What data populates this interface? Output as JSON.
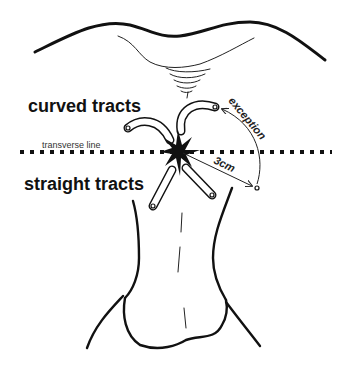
{
  "diagram": {
    "labels": {
      "curved_tracts": "curved tracts",
      "straight_tracts": "straight tracts",
      "transverse_line": "transverse line",
      "exception": "exception",
      "distance": "3cm"
    },
    "elements": {
      "buttock_contour": "upper buttocks outline",
      "anus": "anal opening with radial folds",
      "transverse_line_style": "dotted",
      "central_lesion": "star-shaped internal opening",
      "curved_tract_count": 2,
      "straight_tract_count": 2,
      "perineum_body": "perineum / scrotum outline"
    },
    "colors": {
      "ink": "#111111",
      "background": "#ffffff"
    }
  }
}
